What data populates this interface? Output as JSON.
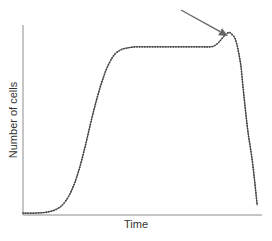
{
  "chart_data": {
    "type": "line",
    "title": "",
    "xlabel": "Time",
    "ylabel": "Number of cells",
    "xlim": [
      0,
      100
    ],
    "ylim": [
      0,
      100
    ],
    "grid": false,
    "legend": null,
    "ticks": {
      "x": [],
      "y": []
    },
    "series": [
      {
        "name": "Cell growth curve",
        "marker": "dot",
        "x": [
          0,
          5,
          10,
          14,
          17,
          20,
          23,
          26,
          29,
          32,
          35,
          38,
          41,
          44,
          47,
          50,
          54,
          58,
          62,
          66,
          70,
          74,
          78,
          80,
          82,
          84,
          86,
          87,
          89,
          91,
          92,
          94,
          96,
          98
        ],
        "y": [
          1,
          1,
          1.5,
          3,
          6,
          12,
          22,
          36,
          52,
          66,
          77,
          84,
          87,
          88,
          88.5,
          88.5,
          88.5,
          88.5,
          88.5,
          88.5,
          88.5,
          88.5,
          88.5,
          89,
          91,
          94,
          96,
          95.5,
          92,
          80,
          68,
          45,
          28,
          5
        ]
      }
    ],
    "annotations": [
      {
        "type": "arrow",
        "from_px": [
          181,
          10
        ],
        "to_px": [
          228,
          36
        ],
        "points_to": "peak before decline",
        "color": "#666666"
      }
    ]
  },
  "colors": {
    "line": "#555555",
    "axis": "#8c8c8c",
    "arrow": "#666666"
  }
}
